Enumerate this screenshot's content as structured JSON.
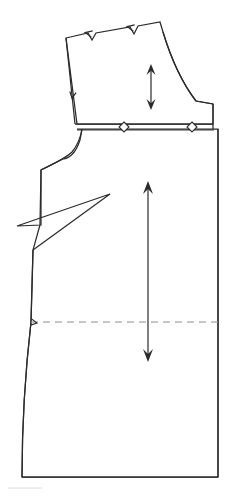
{
  "document": {
    "kind": "sewing-pattern-technical-drawing",
    "title": "Garment Pattern Piece",
    "canvas": {
      "width": 496,
      "height": 496,
      "background": "#ffffff"
    }
  },
  "colors": {
    "outline": "#2b2b2b",
    "inner_line": "#3a3a3a",
    "dashed_guide": "#8d8d8d",
    "arrow": "#2b2b2b",
    "marker_fill": "#ffffff",
    "faint_artifact": "#d8d8d8"
  },
  "geometry": {
    "bodice_outline": "M 66,38 L 88,33 L 92,40 L 96,33 L 130,27 L 134,34 L 138,26 L 160,22 L 163,32 Q 176,75 196,101 L 213,104 L 213,124 L 77,124 Z",
    "bodice_left_edge": "M 66,38 L 75,124",
    "upper_right_curve": "M 163,32 Q 176,75 196,101 L 213,104",
    "skirt_outline": "M 77,129 L 213,129 L 218,129 L 218,477 L 22,477 Q 22,400 31,322 L 33,250 L 40,225 L 41,170 L 63,159 Q 74,158 80,140 L 82,129 Z",
    "waist_line_upper": "M 75,124 L 213,124",
    "waist_line_lower": "M 77,130 L 214,130",
    "armhole_curve": "M 82,129 Q 80,142 72,152 Q 66,158 41,170",
    "dart_path": "M 41,170 L 41,225 L 17,226 L 110,194 L 33,250",
    "side_seam": "M 33,250 L 31,322",
    "hip_dashed_line": "M 31,322 L 218,322",
    "hem_line": "M 22,477 L 218,477",
    "skirt_left_curve": "M 31,322 Q 22,400 22,477",
    "right_edge_upper": "M 213,104 L 213,129",
    "right_edge_lower": "M 218,129 L 218,477"
  },
  "notches": [
    {
      "name": "top-edge-notch-left",
      "x": 92,
      "y": 34,
      "depth": 7,
      "angle": 192
    },
    {
      "name": "top-edge-notch-right",
      "x": 134,
      "y": 28,
      "depth": 7,
      "angle": 192
    },
    {
      "name": "left-edge-notch",
      "x": 73,
      "y": 92,
      "depth": 6,
      "angle": 100
    },
    {
      "name": "side-seam-hip-notch",
      "x": 31,
      "y": 322,
      "depth": 6,
      "angle": 10
    }
  ],
  "diamond_markers": [
    {
      "name": "waist-marker-center",
      "x": 124,
      "y": 127,
      "radius_x": 5,
      "radius_y": 5
    },
    {
      "name": "waist-marker-right",
      "x": 192,
      "y": 127,
      "radius_x": 5,
      "radius_y": 5
    }
  ],
  "grainline_arrows": [
    {
      "name": "bodice-grainline-arrow",
      "label": "upper grainline",
      "x": 151,
      "y_top": 64,
      "y_bottom": 110,
      "double_headed": true,
      "head_width": 9,
      "head_length": 11
    },
    {
      "name": "skirt-grainline-arrow",
      "label": "lower grainline",
      "x": 148,
      "y_top": 181,
      "y_bottom": 362,
      "double_headed": true,
      "head_width": 10,
      "head_length": 13
    }
  ],
  "faint_artifacts": [
    {
      "name": "scan-artifact-bottom-left",
      "x": 8,
      "y": 488,
      "width": 34,
      "height": 3
    }
  ],
  "legend": {
    "solid_line_meaning": "cutting line",
    "dashed_line_meaning": "hip guide line",
    "arrow_meaning": "grainline direction",
    "notch_meaning": "alignment notch",
    "diamond_meaning": "waist match point"
  }
}
